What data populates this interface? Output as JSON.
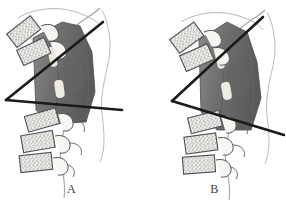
{
  "figure": {
    "width": 286,
    "height": 204,
    "background_color": "#ffffff",
    "type": "anatomical-illustration",
    "panel_count": 2
  },
  "colors": {
    "background": "#ffffff",
    "line_stroke": "#1a1a1a",
    "shaded_segment": "#6e6e6e",
    "shaded_segment_dark": "#5a5a5a",
    "shaded_segment_light": "#8a8a8a",
    "disc_highlight": "#ebe7dd",
    "bone_outline": "#555555",
    "bone_fill": "#f2f1ee",
    "trabecular_speckle": "#7d7d7d",
    "soft_tissue_outline": "#9a9a9a",
    "label_text": "#3b3b3b"
  },
  "panels": [
    {
      "id": "panel-a",
      "label": "A",
      "label_x": 40,
      "label_y": 192,
      "description": "lateral spine tracing with wide intersecting angle lines",
      "angle_lines": {
        "upper": {
          "x1": 6,
          "y1": 100,
          "x2": 103,
          "y2": 22
        },
        "lower": {
          "x1": 6,
          "y1": 100,
          "x2": 122,
          "y2": 110
        },
        "vertex": {
          "x": 6,
          "y": 100
        },
        "stroke_width": 2.6
      },
      "shaded_segment": {
        "outline": "33,38 62,22 80,26 92,52 95,92 86,122 52,124 36,110",
        "discs": [
          {
            "x": 52,
            "y": 56,
            "w": 7,
            "h": 18,
            "rot": -12
          },
          {
            "x": 58,
            "y": 88,
            "w": 9,
            "h": 17,
            "rot": -8
          }
        ]
      },
      "upper_vertebrae": [
        {
          "cx": 24,
          "cy": 32,
          "w": 30,
          "h": 17,
          "rot": -38
        },
        {
          "cx": 34,
          "cy": 52,
          "w": 30,
          "h": 17,
          "rot": -25
        }
      ],
      "lower_vertebrae": [
        {
          "cx": 42,
          "cy": 120,
          "w": 32,
          "h": 16,
          "rot": -16
        },
        {
          "cx": 38,
          "cy": 142,
          "w": 32,
          "h": 17,
          "rot": -10
        },
        {
          "cx": 36,
          "cy": 162,
          "w": 32,
          "h": 17,
          "rot": -6
        }
      ]
    },
    {
      "id": "panel-b",
      "label": "B",
      "label_x": 62,
      "label_y": 194,
      "description": "lateral spine tracing with narrower intersecting angle lines",
      "angle_lines": {
        "upper": {
          "x1": 29,
          "y1": 101,
          "x2": 120,
          "y2": 17
        },
        "lower": {
          "x1": 29,
          "y1": 101,
          "x2": 141,
          "y2": 135
        },
        "vertex": {
          "x": 29,
          "y": 101
        },
        "stroke_width": 2.6
      },
      "shaded_segment": {
        "outline": "56,40 84,22 104,32 114,62 118,98 108,130 74,130 58,112",
        "discs": [
          {
            "x": 76,
            "y": 58,
            "w": 7,
            "h": 18,
            "rot": -14
          },
          {
            "x": 82,
            "y": 90,
            "w": 9,
            "h": 17,
            "rot": -10
          }
        ]
      },
      "upper_vertebrae": [
        {
          "cx": 44,
          "cy": 38,
          "w": 30,
          "h": 17,
          "rot": -36
        },
        {
          "cx": 54,
          "cy": 58,
          "w": 30,
          "h": 17,
          "rot": -24
        }
      ],
      "lower_vertebrae": [
        {
          "cx": 62,
          "cy": 122,
          "w": 32,
          "h": 16,
          "rot": -14
        },
        {
          "cx": 58,
          "cy": 144,
          "w": 32,
          "h": 17,
          "rot": -8
        },
        {
          "cx": 56,
          "cy": 164,
          "w": 32,
          "h": 17,
          "rot": -4
        }
      ]
    }
  ]
}
